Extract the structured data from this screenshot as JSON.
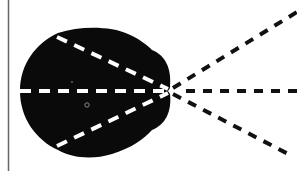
{
  "diagram": {
    "colors": {
      "background": "#ffffff",
      "blob": "#0a0a0a",
      "inner_dashes": "#ffffff",
      "outer_dashes": "#111111",
      "frame_line": "#555555"
    },
    "focal_point": {
      "x": 170,
      "y": 91
    },
    "rays": [
      {
        "name": "upper",
        "inner_start": [
          57,
          36
        ],
        "outer_end": [
          297,
          12
        ]
      },
      {
        "name": "center",
        "inner_start": [
          21,
          91
        ],
        "outer_end": [
          297,
          91
        ]
      },
      {
        "name": "lower",
        "inner_start": [
          57,
          147
        ],
        "outer_end": [
          292,
          156
        ]
      }
    ],
    "marker": {
      "x": 87,
      "y": 105
    }
  }
}
